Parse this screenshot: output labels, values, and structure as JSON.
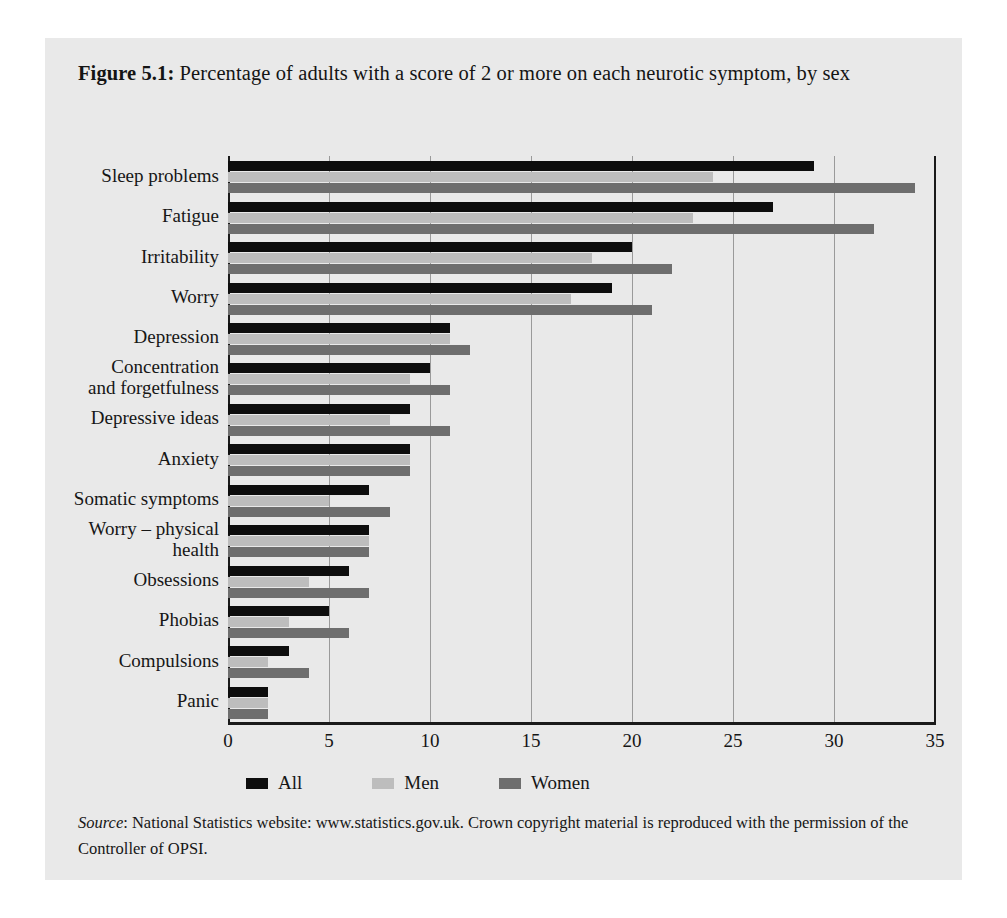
{
  "figure": {
    "label": "Figure 5.1:",
    "caption": " Percentage of adults with a score of 2 or more on each neurotic symptom, by sex",
    "source_word": "Source",
    "source_text": ": National Statistics website: www.statistics.gov.uk. Crown copyright material is reproduced with the permission of the Controller of OPSI."
  },
  "colors": {
    "all": "#0d0d0d",
    "men": "#bdbdbd",
    "women": "#6e6e6e",
    "panel_background": "#e9e9e9",
    "gridline": "#9a9a9a",
    "axis": "#1a1a1a"
  },
  "chart_data": {
    "type": "bar",
    "orientation": "horizontal",
    "title": "Figure 5.1: Percentage of adults with a score of 2 or more on each neurotic symptom, by sex",
    "xlabel": "",
    "ylabel": "",
    "xlim": [
      0,
      35
    ],
    "xticks": [
      0,
      5,
      10,
      15,
      20,
      25,
      30,
      35
    ],
    "grid": true,
    "legend_position": "bottom-left",
    "categories": [
      "Sleep problems",
      "Fatigue",
      "Irritability",
      "Worry",
      "Depression",
      "Concentration\nand forgetfulness",
      "Depressive ideas",
      "Anxiety",
      "Somatic symptoms",
      "Worry – physical\nhealth",
      "Obsessions",
      "Phobias",
      "Compulsions",
      "Panic"
    ],
    "series": [
      {
        "name": "All",
        "values": [
          29,
          27,
          20,
          19,
          11,
          10,
          9,
          9,
          7,
          7,
          6,
          5,
          3,
          2
        ]
      },
      {
        "name": "Men",
        "values": [
          24,
          23,
          18,
          17,
          11,
          9,
          8,
          9,
          5,
          7,
          4,
          3,
          2,
          2
        ]
      },
      {
        "name": "Women",
        "values": [
          34,
          32,
          22,
          21,
          12,
          11,
          11,
          9,
          8,
          7,
          7,
          6,
          4,
          2
        ]
      }
    ]
  }
}
